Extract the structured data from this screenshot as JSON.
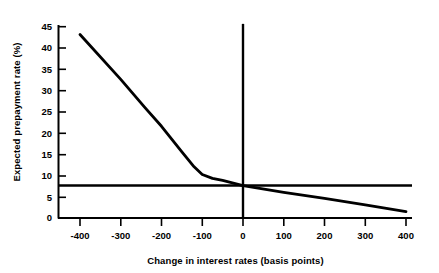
{
  "chart_data": {
    "type": "line",
    "title": "",
    "xlabel": "Change in interest rates (basis points)",
    "ylabel": "Expected prepayment rate (%)",
    "xlim": [
      -440,
      410
    ],
    "ylim": [
      0,
      46
    ],
    "xticks": [
      -400,
      -300,
      -200,
      -100,
      0,
      100,
      200,
      300,
      400
    ],
    "xticklabels": [
      "-400",
      "-300",
      "-200",
      "-100",
      "0",
      "100",
      "200",
      "300",
      "400"
    ],
    "yticks": [
      0,
      5,
      10,
      15,
      20,
      25,
      30,
      35,
      40,
      45
    ],
    "yticklabels": [
      "0",
      "5",
      "10",
      "15",
      "20",
      "25",
      "30",
      "35",
      "40",
      "45"
    ],
    "grid": false,
    "legend": false,
    "series": [
      {
        "name": "Expected prepayment rate",
        "x": [
          -400,
          -300,
          -240,
          -200,
          -150,
          -120,
          -100,
          -75,
          -50,
          0,
          100,
          200,
          300,
          400
        ],
        "values": [
          43.0,
          32.5,
          25.8,
          21.5,
          15.5,
          12.0,
          10.2,
          9.3,
          8.8,
          7.6,
          6.0,
          4.6,
          3.1,
          1.5
        ]
      },
      {
        "name": "Reference level",
        "x": [
          -440,
          400
        ],
        "values": [
          7.6,
          7.6
        ]
      },
      {
        "name": "Current rate marker",
        "x": [
          0,
          0
        ],
        "values": [
          0,
          45.5
        ]
      }
    ],
    "colors": {
      "curve": "#000000",
      "reference_line": "#000000",
      "marker_line": "#000000",
      "axis": "#000000",
      "background": "#ffffff"
    }
  }
}
